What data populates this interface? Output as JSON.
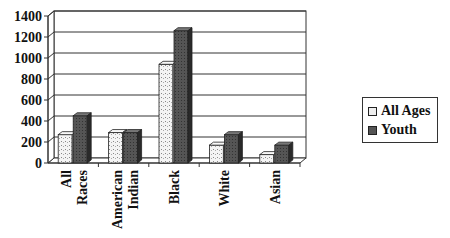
{
  "chart_data": {
    "type": "bar",
    "title": "",
    "xlabel": "",
    "ylabel": "",
    "ylim": [
      0,
      1400
    ],
    "yticks": [
      0,
      200,
      400,
      600,
      800,
      1000,
      1200,
      1400
    ],
    "grid": true,
    "style": "3d-clustered-column",
    "legend_position": "right",
    "categories": [
      "All Races",
      "American Indian",
      "Black",
      "White",
      "Asian"
    ],
    "series": [
      {
        "name": "All Ages",
        "values": [
          270,
          290,
          940,
          170,
          80
        ],
        "color": "#eeeeee"
      },
      {
        "name": "Youth",
        "values": [
          450,
          290,
          1260,
          270,
          170
        ],
        "color": "#555555"
      }
    ]
  },
  "legend": {
    "items": [
      {
        "label": "All Ages"
      },
      {
        "label": "Youth"
      }
    ]
  }
}
